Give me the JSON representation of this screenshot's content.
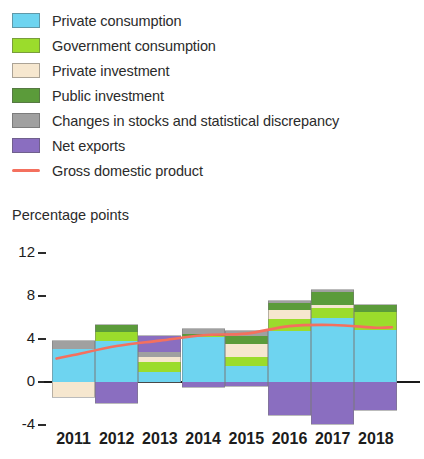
{
  "legend": {
    "items": [
      {
        "label": "Private consumption",
        "color": "#6ed4f0",
        "type": "swatch",
        "icon": "legend-swatch-icon"
      },
      {
        "label": "Government consumption",
        "color": "#9bdc2c",
        "type": "swatch",
        "icon": "legend-swatch-icon"
      },
      {
        "label": "Private investment",
        "color": "#f6e7cf",
        "type": "swatch",
        "icon": "legend-swatch-icon"
      },
      {
        "label": "Public investment",
        "color": "#5b9b3a",
        "type": "swatch",
        "icon": "legend-swatch-icon"
      },
      {
        "label": "Changes in stocks and statistical discrepancy",
        "color": "#a0a0a0",
        "type": "swatch",
        "icon": "legend-swatch-icon"
      },
      {
        "label": "Net exports",
        "color": "#8a6ec0",
        "type": "swatch",
        "icon": "legend-swatch-icon"
      },
      {
        "label": "Gross domestic product",
        "color": "#f4705e",
        "type": "line",
        "icon": "legend-line-icon"
      }
    ]
  },
  "axis": {
    "y_title": "Percentage points",
    "y_ticks": [
      "12",
      "8",
      "4",
      "0",
      "-4"
    ],
    "x_ticks": [
      "2011",
      "2012",
      "2013",
      "2014",
      "2015",
      "2016",
      "2017",
      "2018"
    ]
  },
  "chart_data": {
    "type": "bar",
    "stacked": true,
    "title": "",
    "subtitle": "",
    "xlabel": "",
    "ylabel": "Percentage points",
    "ylim": [
      -4,
      12
    ],
    "ytick_values": [
      12,
      8,
      4,
      0,
      -4
    ],
    "grid": false,
    "legend_position": "top",
    "categories": [
      "2011",
      "2012",
      "2013",
      "2014",
      "2015",
      "2016",
      "2017",
      "2018"
    ],
    "series": [
      {
        "name": "Private consumption",
        "color": "#6ed4f0",
        "values": [
          3.1,
          3.8,
          0.95,
          4.2,
          1.5,
          4.75,
          5.95,
          4.85
        ]
      },
      {
        "name": "Government consumption",
        "color": "#9bdc2c",
        "values": [
          0.0,
          0.85,
          0.95,
          0.1,
          0.85,
          1.1,
          0.95,
          1.65
        ]
      },
      {
        "name": "Private investment",
        "color": "#f6e7cf",
        "values": [
          -1.35,
          0.0,
          0.45,
          0.0,
          1.2,
          0.85,
          0.25,
          0.0
        ]
      },
      {
        "name": "Public investment",
        "color": "#5b9b3a",
        "values": [
          0.0,
          0.65,
          0.0,
          0.15,
          0.75,
          0.65,
          1.2,
          0.65
        ]
      },
      {
        "name": "Changes in stocks and statistical discrepancy",
        "color": "#a0a0a0",
        "values": [
          0.75,
          0.0,
          0.45,
          0.45,
          0.45,
          0.2,
          0.2,
          0.0
        ]
      },
      {
        "name": "Net exports",
        "color": "#8a6ec0",
        "values": [
          0.0,
          -1.95,
          1.5,
          -0.5,
          -0.35,
          -3.1,
          -3.9,
          -2.6
        ]
      }
    ],
    "line_series": {
      "name": "Gross domestic product",
      "color": "#f4705e",
      "values": [
        2.5,
        3.35,
        3.85,
        4.35,
        4.5,
        5.2,
        5.3,
        5.05
      ]
    }
  }
}
